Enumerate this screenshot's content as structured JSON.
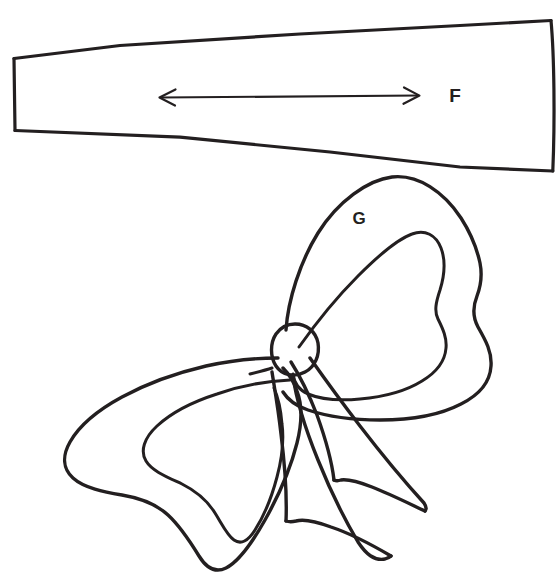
{
  "document": {
    "title": "Sewing Pattern Pieces F and G",
    "background_color": "#ffffff",
    "ink_color": "#231f20",
    "width": 559,
    "height": 580
  },
  "pieces": [
    {
      "id": "piece-f",
      "label": "F",
      "label_x": 455,
      "label_y": 97,
      "shape": "tapered-trapezoid",
      "description": "Long tapered band pattern piece"
    },
    {
      "id": "piece-g",
      "label": "G",
      "label_x": 359,
      "label_y": 220,
      "shape": "bow",
      "description": "Hand drawn ribbon bow illustration"
    }
  ],
  "annotations": {
    "grainline_arrow": {
      "name": "double-headed-arrow",
      "x_start": 160,
      "x_end": 419,
      "y": 97
    }
  },
  "labels": {
    "f": "F",
    "g": "G"
  }
}
